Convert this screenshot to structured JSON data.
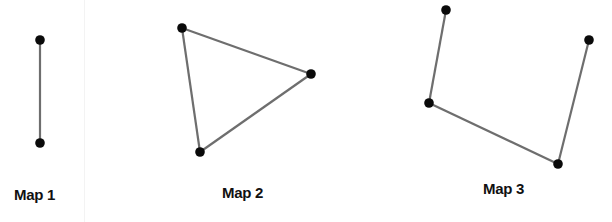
{
  "figure": {
    "edge_color": "#6e6e6e",
    "node_color": "#0a0a0a",
    "maps": [
      {
        "label": "Map 1",
        "nodes": [
          [
            40,
            40
          ],
          [
            40,
            143
          ]
        ],
        "edges": [
          [
            0,
            1
          ]
        ]
      },
      {
        "label": "Map 2",
        "nodes": [
          [
            182,
            28
          ],
          [
            311,
            74
          ],
          [
            200,
            152
          ]
        ],
        "edges": [
          [
            0,
            1
          ],
          [
            1,
            2
          ],
          [
            2,
            0
          ]
        ]
      },
      {
        "label": "Map 3",
        "nodes": [
          [
            446,
            10
          ],
          [
            429,
            103
          ],
          [
            558,
            164
          ],
          [
            589,
            40
          ]
        ],
        "edges": [
          [
            0,
            1
          ],
          [
            1,
            2
          ],
          [
            2,
            3
          ]
        ]
      }
    ]
  }
}
